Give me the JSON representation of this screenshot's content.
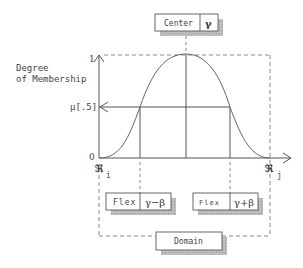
{
  "diagram": {
    "y_axis_label_line1": "Degree",
    "y_axis_label_line2": "of Membership",
    "y_tick_top": "1",
    "y_tick_mid": "μ[.5]",
    "y_tick_zero": "0",
    "x_left_symbol": "ℜ",
    "x_left_sub": "i",
    "x_right_symbol": "ℜ",
    "x_right_sub": "j",
    "center_box": {
      "label": "Center",
      "value": "γ"
    },
    "flex_left_box": {
      "label": "Flex",
      "value": "γ−β"
    },
    "flex_right_box": {
      "label": "Flex",
      "value": "γ+β"
    },
    "domain_box": {
      "label": "Domain"
    },
    "colors": {
      "line": "#555555",
      "dashed": "#888888",
      "text": "#444444",
      "shadow": "#b0b0b0",
      "box_border": "#666666"
    }
  }
}
